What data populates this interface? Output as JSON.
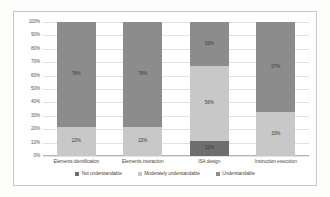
{
  "chart_data": {
    "type": "bar",
    "variant": "stacked-100-percent",
    "title": "",
    "subtitle": "",
    "xlabel": "",
    "ylabel": "",
    "ylim": [
      0,
      100
    ],
    "ytick_labels": [
      "100%",
      "90%",
      "80%",
      "70%",
      "60%",
      "50%",
      "40%",
      "30%",
      "20%",
      "10%",
      "0%"
    ],
    "ytick_values": [
      100,
      90,
      80,
      70,
      60,
      50,
      40,
      30,
      20,
      10,
      0
    ],
    "grid": true,
    "legend_position": "bottom",
    "categories": [
      "Elements identification",
      "Elements interaction",
      "ISA design",
      "Instruction execution"
    ],
    "series": [
      {
        "name": "Not understandable",
        "color": "#6e6e6e",
        "values": [
          0,
          0,
          11,
          0
        ],
        "labels": [
          "",
          "",
          "11%",
          ""
        ]
      },
      {
        "name": "Moderately understandable",
        "color": "#c8c8c8",
        "values": [
          22,
          22,
          56,
          33
        ],
        "labels": [
          "22%",
          "22%",
          "56%",
          "33%"
        ]
      },
      {
        "name": "Understandable",
        "color": "#8c8c8c",
        "values": [
          78,
          78,
          33,
          67
        ],
        "labels": [
          "78%",
          "78%",
          "33%",
          "67%"
        ]
      }
    ],
    "legend": [
      {
        "label": "Not understandable",
        "marker": "square-swatch",
        "color": "#6e6e6e"
      },
      {
        "label": "Moderately understandable",
        "marker": "square-swatch",
        "color": "#c8c8c8"
      },
      {
        "label": "Understandable",
        "marker": "square-swatch",
        "color": "#8c8c8c"
      }
    ]
  }
}
